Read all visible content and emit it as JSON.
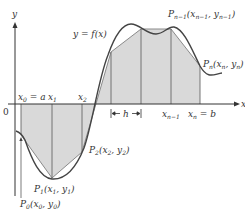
{
  "diagram": {
    "type": "trapezoidal-rule-illustration",
    "axes": {
      "x_label": "x",
      "y_label": "y",
      "origin_label": "0"
    },
    "curve_label": "y = f(x)",
    "tick_labels": [
      {
        "id": "x0",
        "text": "x",
        "sub": "0",
        "suffix": " = a"
      },
      {
        "id": "x1",
        "text": "x",
        "sub": "1",
        "suffix": ""
      },
      {
        "id": "x2",
        "text": "x",
        "sub": "2",
        "suffix": ""
      },
      {
        "id": "xn1",
        "text": "x",
        "sub": "n−1",
        "suffix": ""
      },
      {
        "id": "xn",
        "text": "x",
        "sub": "n",
        "suffix": " = b"
      }
    ],
    "interval_label": "h",
    "points": [
      {
        "id": "P0",
        "name": "P",
        "sub": "0",
        "coords": "(x",
        "csub1": "0",
        "mid": ", y",
        "csub2": "0",
        "end": ")"
      },
      {
        "id": "P1",
        "name": "P",
        "sub": "1",
        "coords": "(x",
        "csub1": "1",
        "mid": ", y",
        "csub2": "1",
        "end": ")"
      },
      {
        "id": "P2",
        "name": "P",
        "sub": "2",
        "coords": "(x",
        "csub1": "2",
        "mid": ", y",
        "csub2": "2",
        "end": ")"
      },
      {
        "id": "Pn1",
        "name": "P",
        "sub": "n−1",
        "coords": "(x",
        "csub1": "n−1",
        "mid": ", y",
        "csub2": "n−1",
        "end": ")"
      },
      {
        "id": "Pn",
        "name": "P",
        "sub": "n",
        "coords": "(x",
        "csub1": "n",
        "mid": ", y",
        "csub2": "n",
        "end": ")"
      }
    ],
    "colors": {
      "fill": "#d9d9d9",
      "curve": "#444444",
      "polygon": "#888888",
      "axis": "#333333"
    }
  }
}
